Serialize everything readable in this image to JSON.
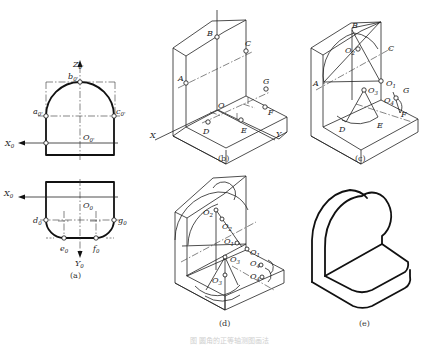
{
  "figure": {
    "caption_faint": "图 圆角的正等轴测图画法",
    "panels": [
      {
        "id": "a",
        "caption": "(a)",
        "front_view_labels": {
          "z_axis": "Z",
          "z_sub": "0'",
          "x_axis": "X",
          "x_sub": "0",
          "origin": "O",
          "origin_sub": "0'",
          "points": [
            {
              "name": "a",
              "sub": "0'"
            },
            {
              "name": "b",
              "sub": "0'"
            },
            {
              "name": "c",
              "sub": "0'"
            }
          ]
        },
        "top_view_labels": {
          "x_axis": "X",
          "x_sub": "0",
          "y_axis": "Y",
          "y_sub": "0",
          "origin": "O",
          "origin_sub": "0",
          "points": [
            {
              "name": "d",
              "sub": "0"
            },
            {
              "name": "e",
              "sub": "0"
            },
            {
              "name": "f",
              "sub": "0"
            },
            {
              "name": "g",
              "sub": "0"
            }
          ]
        }
      },
      {
        "id": "b",
        "caption": "(b)",
        "labels": [
          "A",
          "B",
          "C",
          "O",
          "D",
          "E",
          "F",
          "G",
          "X",
          "Y"
        ]
      },
      {
        "id": "c",
        "caption": "(c)",
        "labels": [
          "A",
          "B",
          "C",
          "D",
          "E",
          "F",
          "G"
        ],
        "centers": [
          {
            "name": "O",
            "sub": "1"
          },
          {
            "name": "O",
            "sub": "2"
          },
          {
            "name": "O",
            "sub": "3"
          },
          {
            "name": "O",
            "sub": "4"
          }
        ]
      },
      {
        "id": "d",
        "caption": "(d)",
        "centers": [
          {
            "name": "O",
            "sub": "2"
          },
          {
            "name": "O",
            "sub": "2"
          },
          {
            "name": "O",
            "sub": "1"
          },
          {
            "name": "O",
            "sub": "1"
          },
          {
            "name": "O",
            "sub": "3"
          },
          {
            "name": "O",
            "sub": "4"
          },
          {
            "name": "O",
            "sub": "4"
          },
          {
            "name": "O",
            "sub": "3"
          }
        ]
      },
      {
        "id": "e",
        "caption": "(e)"
      }
    ]
  }
}
